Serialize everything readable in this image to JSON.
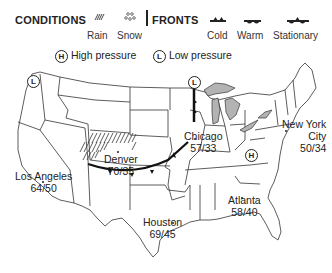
{
  "legend": {
    "conditions_title": "CONDITIONS",
    "fronts_title": "FRONTS",
    "conditions": [
      {
        "label": "Rain",
        "icon": "rain-hatch-icon"
      },
      {
        "label": "Snow",
        "icon": "snow-dots-icon"
      }
    ],
    "fronts": [
      {
        "label": "Cold",
        "icon": "cold-front-icon"
      },
      {
        "label": "Warm",
        "icon": "warm-front-icon"
      },
      {
        "label": "Stationary",
        "icon": "stationary-front-icon"
      }
    ],
    "pressure": [
      {
        "symbol": "H",
        "label": "High pressure"
      },
      {
        "symbol": "L",
        "label": "Low pressure"
      }
    ]
  },
  "cities": [
    {
      "name": "Los Angeles",
      "temps": "64/50"
    },
    {
      "name": "Denver",
      "temps": "70/35"
    },
    {
      "name": "Chicago",
      "temps": "57/33"
    },
    {
      "name": "New York City",
      "name_line1": "New York",
      "name_line2": "City",
      "temps": "50/34"
    },
    {
      "name": "Houston",
      "temps": "69/45"
    },
    {
      "name": "Atlanta",
      "temps": "58/40"
    }
  ],
  "pressure_markers": [
    {
      "symbol": "L",
      "location": "Pacific Northwest"
    },
    {
      "symbol": "L",
      "location": "Upper Midwest"
    },
    {
      "symbol": "H",
      "location": "Ohio Valley"
    }
  ],
  "colors": {
    "lakes": "#b3b3b3",
    "lines": "#222222",
    "background": "#ffffff"
  }
}
